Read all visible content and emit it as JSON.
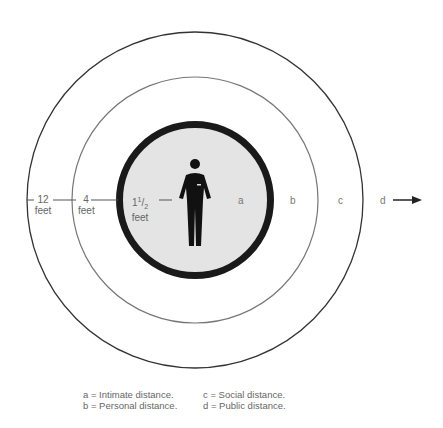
{
  "diagram": {
    "type": "proxemics-zones",
    "distance_labels": [
      {
        "id": "12ft",
        "value": "12",
        "unit": "feet"
      },
      {
        "id": "4ft",
        "value": "4",
        "unit": "feet"
      },
      {
        "id": "1.5ft",
        "whole": "1",
        "num": "1",
        "den": "2",
        "unit": "feet"
      }
    ],
    "zones": [
      {
        "letter": "a"
      },
      {
        "letter": "b"
      },
      {
        "letter": "c"
      },
      {
        "letter": "d"
      }
    ],
    "legend": {
      "a": "a = Intimate distance.",
      "b": "b = Personal distance.",
      "c": "c = Social distance.",
      "d": "d = Public distance."
    },
    "colors": {
      "outer_ring": "#333333",
      "middle_ring": "#777777",
      "inner_ring": "#1a1a1a",
      "inner_fill": "#e4e4e4",
      "figure": "#111111"
    }
  }
}
